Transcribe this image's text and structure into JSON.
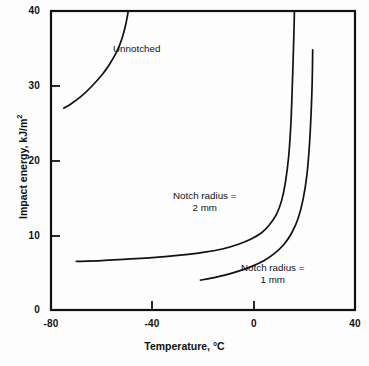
{
  "chart_data": {
    "type": "line",
    "title": "",
    "xlabel": "Temperature, °C",
    "ylabel_main": "Impact energy, kJ/m",
    "ylabel_sup": "2",
    "xlim": [
      -80,
      40
    ],
    "ylim": [
      0,
      40
    ],
    "xticks": [
      -80,
      -40,
      0,
      40
    ],
    "xtick_labels": [
      "-80",
      "-40",
      "0",
      "40"
    ],
    "yticks": [
      0,
      10,
      20,
      30,
      40
    ],
    "ytick_labels": [
      "0",
      "10",
      "20",
      "30",
      "40"
    ],
    "grid": false,
    "legend": "inline-annotations",
    "series": [
      {
        "name": "Unnotched",
        "annotation": "Unnotched",
        "points": [
          [
            -75,
            27.0
          ],
          [
            -72,
            27.6
          ],
          [
            -68,
            28.6
          ],
          [
            -64,
            29.9
          ],
          [
            -60,
            31.4
          ],
          [
            -57,
            32.8
          ],
          [
            -54,
            34.6
          ],
          [
            -52,
            36.3
          ],
          [
            -50.5,
            38.2
          ],
          [
            -49.5,
            40.0
          ]
        ]
      },
      {
        "name": "Notch radius = 2 mm",
        "annotation_line1": "Notch radius =",
        "annotation_line2": "2 mm",
        "points": [
          [
            -70,
            6.5
          ],
          [
            -60,
            6.6
          ],
          [
            -50,
            6.8
          ],
          [
            -40,
            7.0
          ],
          [
            -30,
            7.3
          ],
          [
            -20,
            7.7
          ],
          [
            -12,
            8.2
          ],
          [
            -6,
            8.8
          ],
          [
            -1,
            9.5
          ],
          [
            3,
            10.3
          ],
          [
            6,
            11.3
          ],
          [
            9,
            12.8
          ],
          [
            11,
            14.6
          ],
          [
            12.5,
            17.0
          ],
          [
            13.8,
            20.5
          ],
          [
            14.7,
            25.0
          ],
          [
            15.3,
            30.5
          ],
          [
            15.8,
            36.0
          ],
          [
            16.1,
            40.0
          ]
        ]
      },
      {
        "name": "Notch radius = 1 mm",
        "annotation_line1": "Notch radius =",
        "annotation_line2": "1 mm",
        "points": [
          [
            -21,
            4.0
          ],
          [
            -16,
            4.3
          ],
          [
            -11,
            4.7
          ],
          [
            -6,
            5.2
          ],
          [
            -1,
            5.8
          ],
          [
            4,
            6.6
          ],
          [
            8,
            7.5
          ],
          [
            12,
            8.8
          ],
          [
            15,
            10.3
          ],
          [
            17.5,
            12.2
          ],
          [
            19.5,
            14.8
          ],
          [
            21,
            18.0
          ],
          [
            22,
            22.0
          ],
          [
            22.7,
            26.5
          ],
          [
            23.1,
            30.5
          ],
          [
            23.3,
            34.8
          ]
        ]
      }
    ],
    "colors": {
      "axis": "#111111",
      "curve": "#111111",
      "background": "#fdfdfd",
      "text": "#111111"
    }
  }
}
